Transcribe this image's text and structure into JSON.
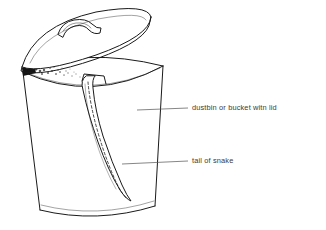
{
  "figure": {
    "kind": "line-drawing",
    "background_color": "#ffffff",
    "ink_color": "#1a1a1a",
    "leader_color": "#5d5d5d",
    "label_color": "#3a3a3a"
  },
  "labels": [
    {
      "id": "bucket",
      "text": "dustbin or bucket witn lid",
      "x": 192,
      "y": 108
    },
    {
      "id": "tail",
      "text": "tail of snake",
      "x": 192,
      "y": 161
    }
  ],
  "parts": {
    "lid": "lid",
    "lid_handle": "lid-handle",
    "bucket_rim": "bucket-rim",
    "bucket_body": "bucket-body",
    "bucket_base": "bucket-base",
    "snake_tail": "snake-tail",
    "rim_shadow": "rim-shadow"
  }
}
